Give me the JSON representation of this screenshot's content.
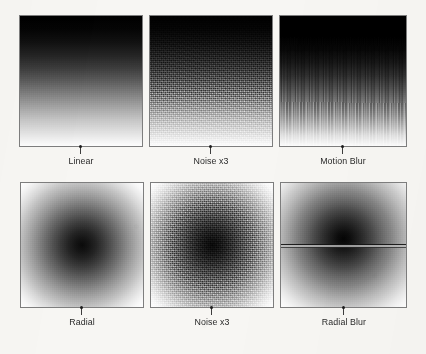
{
  "figure": {
    "background_color": "#f7f6f3",
    "border_color": "#7e7e7e",
    "tick_color": "#3d3d3d",
    "label_color": "#2b2b2b",
    "rows": 2,
    "columns": 3
  },
  "panels": [
    {
      "id": "linear",
      "label": "Linear",
      "gradient_type": "linear",
      "direction": "top-to-bottom",
      "from_color": "#000000",
      "to_color": "#ffffff",
      "effect": "none",
      "row": 1,
      "column": 1
    },
    {
      "id": "linear-noise-x3",
      "label": "Noise x3",
      "gradient_type": "linear",
      "direction": "top-to-bottom",
      "from_color": "#000000",
      "to_color": "#ffffff",
      "effect": "noise",
      "row": 1,
      "column": 2
    },
    {
      "id": "linear-motion-blur",
      "label": "Motion Blur",
      "gradient_type": "linear",
      "direction": "top-to-bottom",
      "from_color": "#000000",
      "to_color": "#ffffff",
      "effect": "motion-blur",
      "row": 1,
      "column": 3
    },
    {
      "id": "radial",
      "label": "Radial",
      "gradient_type": "radial",
      "direction": "center-to-edge",
      "from_color": "#000000",
      "to_color": "#ffffff",
      "effect": "none",
      "row": 2,
      "column": 1
    },
    {
      "id": "radial-noise-x3",
      "label": "Noise x3",
      "gradient_type": "radial",
      "direction": "center-to-edge",
      "from_color": "#000000",
      "to_color": "#ffffff",
      "effect": "noise",
      "row": 2,
      "column": 2
    },
    {
      "id": "radial-blur",
      "label": "Radial Blur",
      "gradient_type": "radial",
      "direction": "center-to-edge",
      "from_color": "#000000",
      "to_color": "#ffffff",
      "effect": "radial-blur",
      "row": 2,
      "column": 3
    }
  ]
}
